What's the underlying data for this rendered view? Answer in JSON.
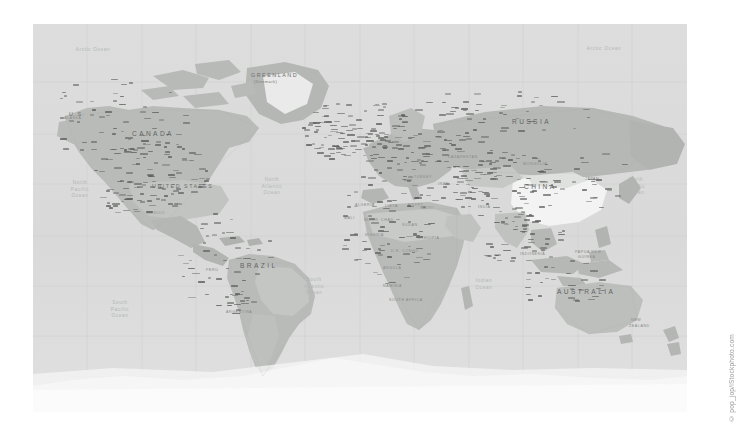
{
  "image": {
    "kind": "world-political-map",
    "background_color": "#ffffff",
    "ocean_color": "#d9dad9",
    "land_color": "#b9bbb9",
    "land_light_color": "#cfd1cf",
    "land_white_color": "#f2f3f2",
    "antarctica_color": "#fbfbfb",
    "grid_color": "#c8cac8",
    "label_color": "#6d6f6d",
    "ocean_label_color": "#b2b6b8"
  },
  "map": {
    "frame": {
      "x": 33,
      "y": 24,
      "width": 654,
      "height": 388
    },
    "projection": "Mercator",
    "graticule": {
      "visible": true,
      "longitude_step_deg": 30,
      "latitude_step_deg": 30
    }
  },
  "continent_labels": [
    {
      "text": "CANADA",
      "x": 132,
      "y": 130,
      "style": "big"
    },
    {
      "text": "U.S.",
      "x": 69,
      "y": 111,
      "style": "country"
    },
    {
      "text": "UNITED STATES",
      "x": 152,
      "y": 183,
      "style": "country"
    },
    {
      "text": "MEXICO",
      "x": 147,
      "y": 211,
      "style": "small"
    },
    {
      "text": "GREENLAND",
      "x": 251,
      "y": 72,
      "style": "country"
    },
    {
      "text": "(Denmark)",
      "x": 254,
      "y": 79,
      "style": "sub"
    },
    {
      "text": "BRAZIL",
      "x": 240,
      "y": 262,
      "style": "big"
    },
    {
      "text": "ARGENTINA",
      "x": 226,
      "y": 310,
      "style": "small"
    },
    {
      "text": "PERU",
      "x": 206,
      "y": 268,
      "style": "small"
    },
    {
      "text": "RUSSIA",
      "x": 512,
      "y": 118,
      "style": "big"
    },
    {
      "text": "CHINA",
      "x": 524,
      "y": 183,
      "style": "big"
    },
    {
      "text": "KAZAKHSTAN",
      "x": 448,
      "y": 155,
      "style": "small"
    },
    {
      "text": "MONGOLIA",
      "x": 523,
      "y": 162,
      "style": "small"
    },
    {
      "text": "INDIA",
      "x": 478,
      "y": 205,
      "style": "small"
    },
    {
      "text": "IRAN",
      "x": 438,
      "y": 182,
      "style": "small"
    },
    {
      "text": "ALGERIA",
      "x": 355,
      "y": 203,
      "style": "small"
    },
    {
      "text": "LIBYA",
      "x": 385,
      "y": 204,
      "style": "small"
    },
    {
      "text": "EGYPT",
      "x": 408,
      "y": 203,
      "style": "small"
    },
    {
      "text": "SUDAN",
      "x": 402,
      "y": 223,
      "style": "small"
    },
    {
      "text": "CHAD",
      "x": 381,
      "y": 218,
      "style": "small"
    },
    {
      "text": "NIGER",
      "x": 364,
      "y": 218,
      "style": "small"
    },
    {
      "text": "MALI",
      "x": 344,
      "y": 216,
      "style": "small"
    },
    {
      "text": "NIGERIA",
      "x": 365,
      "y": 233,
      "style": "small"
    },
    {
      "text": "D.R. CONGO",
      "x": 391,
      "y": 249,
      "style": "small"
    },
    {
      "text": "ANGOLA",
      "x": 383,
      "y": 266,
      "style": "small"
    },
    {
      "text": "NAMIBIA",
      "x": 383,
      "y": 284,
      "style": "small"
    },
    {
      "text": "SOUTH AFRICA",
      "x": 389,
      "y": 298,
      "style": "small"
    },
    {
      "text": "ETHIOPIA",
      "x": 418,
      "y": 236,
      "style": "small"
    },
    {
      "text": "SAUDI",
      "x": 420,
      "y": 206,
      "style": "small"
    },
    {
      "text": "TURKEY",
      "x": 414,
      "y": 175,
      "style": "small"
    },
    {
      "text": "AUSTRALIA",
      "x": 557,
      "y": 288,
      "style": "big"
    },
    {
      "text": "INDONESIA",
      "x": 520,
      "y": 252,
      "style": "small"
    },
    {
      "text": "NEW",
      "x": 631,
      "y": 318,
      "style": "small"
    },
    {
      "text": "ZEALAND",
      "x": 629,
      "y": 324,
      "style": "small"
    },
    {
      "text": "PAPUA NEW",
      "x": 575,
      "y": 250,
      "style": "small"
    },
    {
      "text": "GUINEA",
      "x": 578,
      "y": 255,
      "style": "small"
    },
    {
      "text": "JAPAN",
      "x": 585,
      "y": 177,
      "style": "small"
    },
    {
      "text": "ALASKA",
      "x": 64,
      "y": 116,
      "style": "small"
    }
  ],
  "ocean_labels": [
    {
      "lines": [
        "Arctic Ocean"
      ],
      "x": 93,
      "y": 47,
      "style": "ocean"
    },
    {
      "lines": [
        "Arctic Ocean"
      ],
      "x": 604,
      "y": 46,
      "style": "ocean"
    },
    {
      "lines": [
        "North",
        "Pacific",
        "Ocean"
      ],
      "x": 80,
      "y": 180,
      "style": "ocean"
    },
    {
      "lines": [
        "North",
        "Pacific",
        "Ocean"
      ],
      "x": 636,
      "y": 177,
      "style": "ocean"
    },
    {
      "lines": [
        "North",
        "Atlantic",
        "Ocean"
      ],
      "x": 272,
      "y": 177,
      "style": "ocean"
    },
    {
      "lines": [
        "South",
        "Atlantic",
        "Ocean"
      ],
      "x": 314,
      "y": 277,
      "style": "ocean"
    },
    {
      "lines": [
        "South",
        "Pacific",
        "Ocean"
      ],
      "x": 120,
      "y": 300,
      "style": "ocean"
    },
    {
      "lines": [
        "Indian",
        "Ocean"
      ],
      "x": 484,
      "y": 278,
      "style": "ocean"
    }
  ],
  "copyright": {
    "symbol": "©",
    "text": "pop_jop/iStockphoto.com",
    "full": "© pop_jop/iStockphoto.com",
    "orientation": "vertical"
  }
}
